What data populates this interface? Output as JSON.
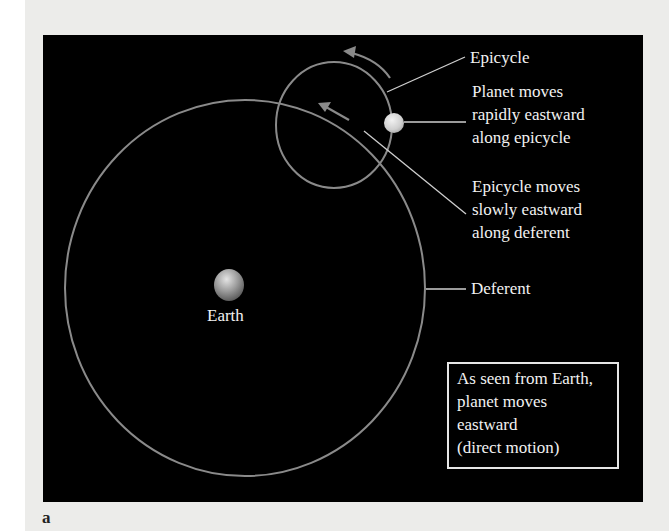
{
  "figure": {
    "letter": "a",
    "panel_background": "#000000",
    "page_background": "#ececea",
    "line_color": "#8a8a8a",
    "text_color": "#f2f2f2"
  },
  "labels": {
    "epicycle": "Epicycle",
    "planet_motion": [
      "Planet moves",
      "rapidly eastward",
      "along epicycle"
    ],
    "epicycle_motion": [
      "Epicycle moves",
      "slowly eastward",
      "along deferent"
    ],
    "deferent": "Deferent",
    "earth": "Earth"
  },
  "note_box": {
    "lines": [
      "As seen from Earth,",
      "planet moves",
      "eastward",
      "(direct motion)"
    ]
  },
  "icons": {
    "earth": "earth-sphere-icon",
    "planet": "planet-sphere-icon",
    "epicycle_arrow": "curved-arrow-icon",
    "deferent_arrow": "straight-arrow-icon"
  }
}
